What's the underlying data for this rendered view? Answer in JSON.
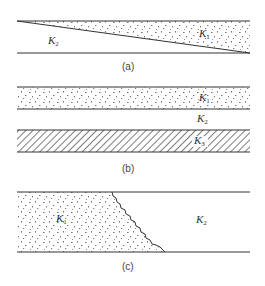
{
  "figure": {
    "panels": [
      {
        "id": "a",
        "caption": "(a)",
        "description": "Wedge of medium K1 (dotted) over medium K2 between two horizontal lines",
        "regions": [
          {
            "label_base": "K",
            "label_sub": "2",
            "fill": "none"
          },
          {
            "label_base": "K",
            "label_sub": "1",
            "fill": "dotted"
          }
        ]
      },
      {
        "id": "b",
        "caption": "(b)",
        "description": "Layered media: dotted K1 band, K2 gap, hatched K3 band",
        "regions": [
          {
            "label_base": "K",
            "label_sub": "1",
            "fill": "dotted"
          },
          {
            "label_base": "K",
            "label_sub": "2",
            "fill": "none"
          },
          {
            "label_base": "K",
            "label_sub": "3",
            "fill": "hatched"
          }
        ]
      },
      {
        "id": "c",
        "caption": "(c)",
        "description": "Dotted K1 region separated from K2 by a wavy inclined interface",
        "regions": [
          {
            "label_base": "K",
            "label_sub": "1",
            "fill": "dotted"
          },
          {
            "label_base": "K",
            "label_sub": "2",
            "fill": "none"
          }
        ]
      }
    ]
  },
  "colors": {
    "line": "#333333",
    "dots": "#555555",
    "hatch": "#444444",
    "background": "#ffffff"
  }
}
